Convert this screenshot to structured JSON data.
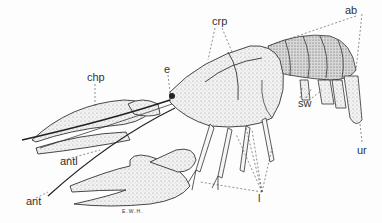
{
  "figure": {
    "labels": {
      "ab": "ab",
      "crp": "crp",
      "chp": "chp",
      "e": "e",
      "sw": "sw",
      "ur": "ur",
      "antl": "antl",
      "ant": "ant",
      "l": "l"
    },
    "signature": "E.W.H."
  },
  "colors": {
    "background": "#fdfdfd",
    "ink": "#333333"
  }
}
